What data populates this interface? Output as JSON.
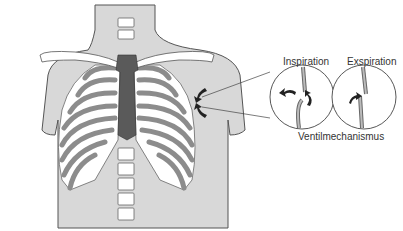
{
  "diagram": {
    "labels": {
      "inspiration": "Inspiration",
      "exspiration": "Exspiration",
      "mechanism": "Ventilmechanismus"
    },
    "colors": {
      "skin": "#d8d8d8",
      "outline": "#555555",
      "bone": "#ffffff",
      "rib_cartilage": "#8c8c8c",
      "sternum": "#5a5a5a",
      "arrow": "#222222"
    }
  }
}
